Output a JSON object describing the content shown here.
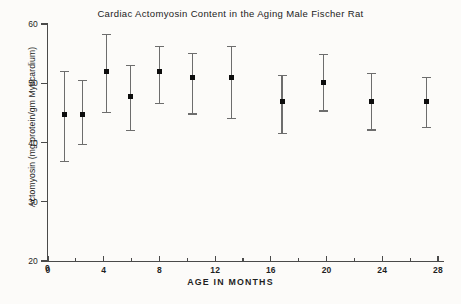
{
  "chart_data": {
    "type": "scatter",
    "title": "Cardiac Actomyosin Content in the Aging Male Fischer Rat",
    "xlabel": "AGE IN MONTHS",
    "ylabel": "Actomyosin (mg protein/gm Myocardium)",
    "xlim": [
      0,
      28
    ],
    "ylim": [
      20,
      60
    ],
    "grid": false,
    "legend": null,
    "x_ticks": [
      0,
      4,
      8,
      12,
      16,
      20,
      24,
      28
    ],
    "x_tick_labels": [
      "0",
      "4",
      "8",
      "12",
      "16",
      "20",
      "24",
      "28"
    ],
    "x_minor_ticks": [
      2,
      6,
      10,
      14,
      18,
      22,
      26
    ],
    "y_ticks": [
      20,
      30,
      40,
      50,
      60
    ],
    "y_tick_labels": [
      "20",
      "30",
      "40",
      "50",
      "60"
    ],
    "series": [
      {
        "name": "Actomyosin content",
        "marker": "square",
        "color": "#0d0d0d",
        "errorbar_color": "#6d6d6d",
        "points": [
          {
            "x": 1.2,
            "y": 44.7,
            "err_low": 36.8,
            "err_high": 52.0
          },
          {
            "x": 2.5,
            "y": 44.8,
            "err_low": 39.6,
            "err_high": 50.5
          },
          {
            "x": 4.2,
            "y": 52.0,
            "err_low": 45.1,
            "err_high": 58.2
          },
          {
            "x": 5.9,
            "y": 47.8,
            "err_low": 42.0,
            "err_high": 53.0
          },
          {
            "x": 8.0,
            "y": 52.0,
            "err_low": 46.6,
            "err_high": 56.2
          },
          {
            "x": 10.4,
            "y": 50.9,
            "err_low": 44.8,
            "err_high": 55.0
          },
          {
            "x": 13.2,
            "y": 51.0,
            "err_low": 44.0,
            "err_high": 56.2
          },
          {
            "x": 16.8,
            "y": 46.9,
            "err_low": 41.5,
            "err_high": 51.3
          },
          {
            "x": 19.8,
            "y": 50.1,
            "err_low": 45.3,
            "err_high": 54.9
          },
          {
            "x": 23.2,
            "y": 46.9,
            "err_low": 42.1,
            "err_high": 51.6
          },
          {
            "x": 27.2,
            "y": 46.9,
            "err_low": 42.5,
            "err_high": 51.0
          }
        ]
      }
    ]
  },
  "origin_marker": "0"
}
